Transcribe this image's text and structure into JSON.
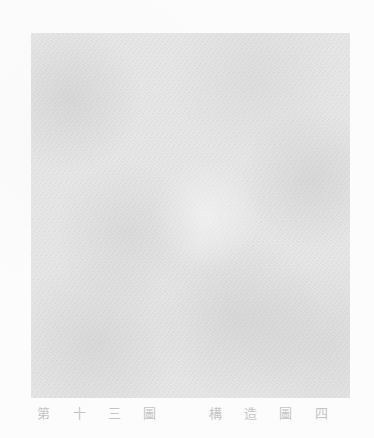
{
  "plate": {
    "description": "faint grey halftone plate",
    "tone": "#ececec"
  },
  "caption": {
    "part1": "第 十 三 圖",
    "part2": "構 造 圖 四"
  }
}
